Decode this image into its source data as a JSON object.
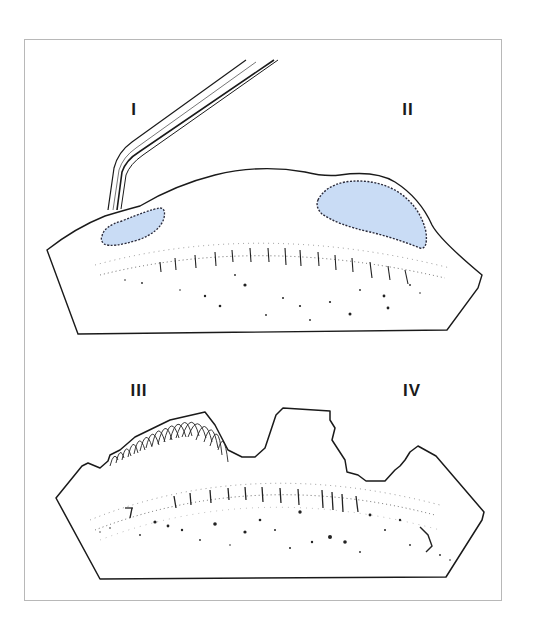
{
  "figure": {
    "colors": {
      "background": "#ffffff",
      "frame_border": "#b8b8b8",
      "outline": "#1a1a1a",
      "lesion_fill": "#c9dcf5",
      "stipple": "#222222"
    },
    "panels": [
      {
        "id": "I",
        "label": "I",
        "description": "tissue section with forceps probing a small blue lesion at left"
      },
      {
        "id": "II",
        "label": "II",
        "description": "large blue crescent-shaped lesion beneath the surface at right"
      },
      {
        "id": "III",
        "label": "III",
        "description": "frayed / fibrous surface with hatched strands at left"
      },
      {
        "id": "IV",
        "label": "IV",
        "description": "irregular stepped defect with jagged surface at right"
      }
    ]
  }
}
